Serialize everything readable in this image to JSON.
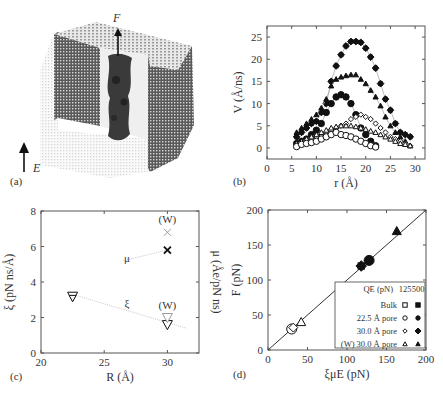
{
  "figure": {
    "panel_labels": {
      "a": "(a)",
      "b": "(b)",
      "c": "(c)",
      "d": "(d)"
    }
  },
  "panel_a": {
    "force_label": "F",
    "field_label": "E"
  },
  "chart_data": [
    {
      "panel": "b",
      "type": "line",
      "xlabel": "r (Å)",
      "ylabel": "V (Å/ns)",
      "xlim": [
        0,
        32
      ],
      "ylim": [
        -2.5,
        27.5
      ],
      "xticks": [
        0,
        5,
        10,
        15,
        20,
        25,
        30
      ],
      "yticks": [
        0,
        5,
        10,
        15,
        20,
        25
      ],
      "series": [
        {
          "name": "30.0 Å pore, 500 pN",
          "marker": "filled-diamond",
          "x": [
            6,
            7,
            8,
            9,
            10,
            11,
            12,
            13,
            14,
            15,
            16,
            17,
            18,
            19,
            20,
            21,
            22,
            23,
            24,
            25,
            26,
            27,
            28,
            29
          ],
          "y": [
            2.5,
            3.5,
            4.5,
            5.5,
            6,
            8,
            10,
            15,
            18.5,
            21,
            23,
            24,
            24,
            23.8,
            22.5,
            20.5,
            18,
            14.5,
            11,
            8.5,
            5.5,
            3.5,
            3,
            2.5
          ]
        },
        {
          "name": "(W) 30.0 Å pore, 500 pN",
          "marker": "filled-triangle",
          "x": [
            6,
            7,
            8,
            9,
            10,
            11,
            12,
            13,
            14,
            15,
            16,
            17,
            18,
            19,
            20,
            21,
            22,
            23,
            24,
            25,
            26,
            27,
            28,
            29
          ],
          "y": [
            3.5,
            4.5,
            5.5,
            6.5,
            7.5,
            9,
            11,
            14,
            15.5,
            16,
            16.3,
            16.5,
            16.5,
            15.5,
            14.5,
            13,
            11.5,
            9.5,
            7,
            5,
            3.5,
            2.5,
            1.5,
            0.5
          ]
        },
        {
          "name": "22.5 Å pore, 500 pN",
          "marker": "filled-circle",
          "x": [
            6,
            7,
            8,
            9,
            10,
            11,
            12,
            13,
            14,
            15,
            16,
            17,
            18,
            19,
            20,
            21,
            22
          ],
          "y": [
            1,
            1.5,
            2,
            3,
            4,
            5.5,
            8,
            10,
            11.5,
            12,
            11.5,
            10,
            7.5,
            4.5,
            3,
            1.5,
            0.5
          ]
        },
        {
          "name": "30.0 Å pore, 125 pN",
          "marker": "open-diamond",
          "x": [
            6,
            7,
            8,
            9,
            10,
            11,
            12,
            13,
            14,
            15,
            16,
            17,
            18,
            19,
            20,
            21,
            22,
            23,
            24,
            25,
            26,
            27,
            28,
            29
          ],
          "y": [
            0.5,
            1,
            1.5,
            2,
            2.5,
            3,
            3.5,
            4,
            4.5,
            5,
            5.5,
            6.5,
            7,
            7.5,
            7,
            6.5,
            5.5,
            4.5,
            3.5,
            2.5,
            2,
            1.5,
            1,
            0.5
          ]
        },
        {
          "name": "(W) 30.0 Å pore, 125 pN",
          "marker": "open-triangle",
          "x": [
            6,
            7,
            8,
            9,
            10,
            11,
            12,
            13,
            14,
            15,
            16,
            17,
            18,
            19,
            20,
            21,
            22,
            23,
            24,
            25,
            26,
            27,
            28,
            29
          ],
          "y": [
            1,
            1.5,
            2,
            2.5,
            3,
            3.5,
            4,
            4.5,
            4.8,
            5,
            5,
            5,
            4.8,
            4.5,
            4.2,
            3.8,
            3.5,
            3,
            2.5,
            2,
            1.5,
            1,
            0.8,
            0.5
          ]
        },
        {
          "name": "22.5 Å pore, 125 pN",
          "marker": "open-circle",
          "x": [
            6,
            7,
            8,
            9,
            10,
            11,
            12,
            13,
            14,
            15,
            16,
            17,
            18,
            19,
            20,
            21,
            22
          ],
          "y": [
            0.3,
            0.8,
            1,
            1.2,
            1.5,
            2,
            2.5,
            3,
            3.5,
            3,
            2.8,
            2.5,
            2,
            1.5,
            1,
            0.5,
            0.2
          ]
        }
      ]
    },
    {
      "panel": "c",
      "type": "scatter",
      "xlabel": "R (Å)",
      "ylabel_left": "ξ (pN ns/Å)",
      "ylabel_right": "μ (Åe/pN ns)",
      "xlim": [
        20,
        32.5
      ],
      "ylim": [
        0,
        8
      ],
      "xticks": [
        20,
        25,
        30
      ],
      "yticks": [
        0,
        2,
        4,
        6,
        8
      ],
      "points": [
        {
          "label": "ξ 22.5",
          "marker": "open-triangle-down",
          "x": 22.5,
          "y": 3.2
        },
        {
          "label": "μ 22.5",
          "marker": "cross",
          "x": 22.5,
          "y": 3.2
        },
        {
          "label": "μ 30.0",
          "marker": "cross",
          "x": 30,
          "y": 5.8
        },
        {
          "label": "μ 30.0 (W)",
          "marker": "cross-gray",
          "x": 30,
          "y": 6.8
        },
        {
          "label": "ξ 30.0",
          "marker": "open-triangle-down",
          "x": 30,
          "y": 1.6
        },
        {
          "label": "ξ 30.0 (W)",
          "marker": "open-triangle-down-gray",
          "x": 30,
          "y": 2.0
        }
      ],
      "annotations": [
        {
          "text": "(W)",
          "x": 30,
          "y": 7.3
        },
        {
          "text": "μ",
          "x": 26.8,
          "y": 5.1
        },
        {
          "text": "ξ",
          "x": 26.8,
          "y": 2.6
        },
        {
          "text": "(W)",
          "x": 30,
          "y": 2.5
        }
      ],
      "trend_lines": [
        {
          "name": "μ",
          "from": [
            26.5,
            5.2
          ],
          "to": [
            30,
            5.8
          ]
        },
        {
          "name": "ξ",
          "from": [
            22.5,
            3.3
          ],
          "to": [
            31.5,
            1.4
          ]
        }
      ]
    },
    {
      "panel": "d",
      "type": "scatter",
      "xlabel": "ξμE (pN)",
      "ylabel": "F (pN)",
      "xlim": [
        0,
        200
      ],
      "ylim": [
        0,
        200
      ],
      "xticks": [
        0,
        50,
        100,
        150,
        200
      ],
      "yticks": [
        0,
        50,
        100,
        150,
        200
      ],
      "reference_line": {
        "from": [
          0,
          0
        ],
        "to": [
          200,
          200
        ]
      },
      "legend": {
        "header": "QE (pN)",
        "columns": [
          "125",
          "500"
        ],
        "rows": [
          "Bulk",
          "22.5 Å pore",
          "30.0 Å pore",
          "(W) 30.0 Å pore"
        ]
      },
      "points": [
        {
          "series": "22.5 Å pore",
          "QE": 125,
          "marker": "open-circle",
          "x": 30,
          "y": 30
        },
        {
          "series": "30.0 Å pore",
          "QE": 125,
          "marker": "open-diamond",
          "x": 32,
          "y": 32
        },
        {
          "series": "(W) 30.0 Å pore",
          "QE": 125,
          "marker": "open-triangle",
          "x": 42,
          "y": 40
        },
        {
          "series": "30.0 Å pore",
          "QE": 500,
          "marker": "filled-diamond",
          "x": 118,
          "y": 120
        },
        {
          "series": "22.5 Å pore",
          "QE": 500,
          "marker": "filled-circle",
          "x": 128,
          "y": 128
        },
        {
          "series": "(W) 30.0 Å pore",
          "QE": 500,
          "marker": "filled-triangle",
          "x": 163,
          "y": 170
        }
      ]
    }
  ]
}
